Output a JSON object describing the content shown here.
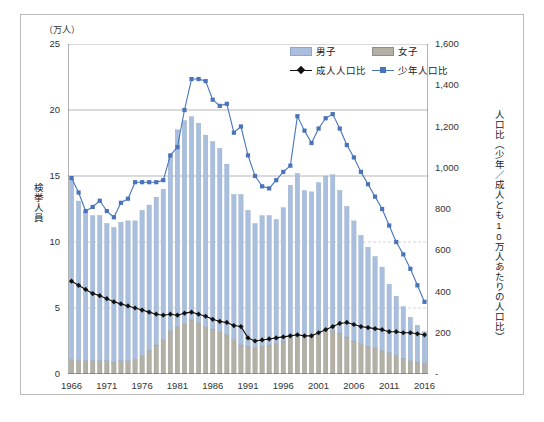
{
  "figure": {
    "left_unit": "（万人）",
    "left_axis_title": "検挙人員",
    "right_axis_title": "人口比（少年／成人とも10万人あたりの人口比）",
    "caption": "",
    "border_color": "#b9b9b9"
  },
  "legend": {
    "items": [
      {
        "label": "男子",
        "type": "bar",
        "color": "#aabfdd",
        "name": "legend-male"
      },
      {
        "label": "女子",
        "type": "bar",
        "color": "#b3b0a6",
        "name": "legend-female"
      },
      {
        "label": "成人人口比",
        "type": "line-diamond",
        "color": "#111111",
        "name": "legend-adult-ratio"
      },
      {
        "label": "少年人口比",
        "type": "line-square",
        "color": "#4a74ba",
        "name": "legend-juvenile-ratio"
      }
    ]
  },
  "chart_data": {
    "type": "bar",
    "title": "",
    "subtitle": "",
    "xlabel": "",
    "ylabel": "検挙人員",
    "y2label": "人口比（少年／成人とも10万人あたりの人口比）",
    "unit_left": "万人",
    "ylim": [
      0,
      25
    ],
    "yticks": [
      0,
      5,
      10,
      15,
      20,
      25
    ],
    "y2lim": [
      0,
      1600
    ],
    "y2ticks": [
      "-",
      "200",
      "400",
      "600",
      "800",
      "1,000",
      "1,200",
      "1,400",
      "1,600"
    ],
    "y2tick_values": [
      0,
      200,
      400,
      600,
      800,
      1000,
      1200,
      1400,
      1600
    ],
    "grid": "horizontal",
    "legend_position": "top-right",
    "stacked": true,
    "x": [
      1966,
      1967,
      1968,
      1969,
      1970,
      1971,
      1972,
      1973,
      1974,
      1975,
      1976,
      1977,
      1978,
      1979,
      1980,
      1981,
      1982,
      1983,
      1984,
      1985,
      1986,
      1987,
      1988,
      1989,
      1990,
      1991,
      1992,
      1993,
      1994,
      1995,
      1996,
      1997,
      1998,
      1999,
      2000,
      2001,
      2002,
      2003,
      2004,
      2005,
      2006,
      2007,
      2008,
      2009,
      2010,
      2011,
      2012,
      2013,
      2014,
      2015,
      2016
    ],
    "xticks": [
      1966,
      1971,
      1976,
      1981,
      1986,
      1991,
      1996,
      2001,
      2006,
      2011,
      2016
    ],
    "series": [
      {
        "name": "女子",
        "color": "#b3b0a6",
        "axis": "left",
        "values": [
          1.1,
          1.0,
          1.0,
          1.0,
          1.0,
          1.0,
          0.9,
          1.0,
          1.0,
          1.1,
          1.4,
          1.8,
          2.2,
          2.6,
          3.3,
          3.6,
          3.8,
          4.1,
          3.9,
          3.6,
          3.4,
          3.2,
          3.0,
          2.6,
          2.2,
          2.1,
          2.0,
          2.1,
          2.2,
          2.3,
          2.5,
          2.8,
          2.9,
          2.8,
          2.8,
          3.0,
          3.2,
          3.3,
          3.1,
          2.8,
          2.5,
          2.3,
          2.1,
          2.0,
          1.8,
          1.6,
          1.4,
          1.2,
          1.0,
          0.9,
          0.8
        ]
      },
      {
        "name": "男子",
        "color": "#aabfdd",
        "axis": "left",
        "values": [
          13.7,
          12.1,
          11.3,
          11.0,
          11.0,
          10.4,
          10.2,
          10.5,
          10.6,
          10.5,
          11.0,
          11.0,
          11.2,
          11.4,
          13.3,
          14.9,
          15.4,
          15.4,
          15.1,
          14.5,
          14.2,
          13.9,
          12.9,
          11.0,
          11.4,
          10.3,
          9.4,
          9.9,
          9.8,
          9.4,
          10.1,
          11.5,
          12.3,
          11.1,
          11.0,
          11.5,
          11.8,
          11.8,
          10.8,
          9.9,
          9.1,
          8.2,
          7.5,
          6.9,
          6.3,
          5.2,
          4.5,
          3.9,
          3.3,
          2.8,
          2.4
        ]
      }
    ],
    "totals": [
      14.8,
      13.1,
      12.3,
      12.0,
      12.0,
      11.4,
      11.1,
      11.5,
      11.6,
      11.6,
      12.4,
      12.8,
      13.4,
      14.0,
      16.6,
      18.5,
      19.2,
      19.5,
      19.0,
      18.1,
      17.6,
      17.1,
      15.9,
      13.6,
      13.6,
      12.4,
      11.4,
      12.0,
      12.0,
      11.7,
      12.6,
      14.3,
      15.2,
      13.9,
      13.8,
      14.5,
      15.0,
      15.1,
      13.9,
      12.7,
      11.6,
      10.5,
      9.6,
      8.9,
      8.1,
      6.8,
      5.9,
      5.1,
      4.3,
      3.7,
      3.2
    ],
    "lines": [
      {
        "name": "少年人口比",
        "color": "#4a74ba",
        "marker": "square",
        "axis": "right",
        "values": [
          950,
          880,
          790,
          810,
          840,
          790,
          760,
          830,
          850,
          930,
          930,
          930,
          930,
          940,
          1060,
          1100,
          1280,
          1430,
          1430,
          1420,
          1330,
          1300,
          1310,
          1170,
          1200,
          1060,
          960,
          910,
          900,
          940,
          980,
          1010,
          1250,
          1180,
          1120,
          1190,
          1240,
          1260,
          1190,
          1110,
          1050,
          980,
          920,
          860,
          800,
          720,
          640,
          580,
          510,
          430,
          350
        ]
      },
      {
        "name": "成人人口比",
        "color": "#111111",
        "marker": "diamond",
        "axis": "right",
        "values": [
          450,
          430,
          410,
          390,
          380,
          365,
          350,
          340,
          330,
          320,
          310,
          300,
          290,
          285,
          290,
          285,
          295,
          300,
          290,
          280,
          265,
          255,
          250,
          235,
          230,
          175,
          160,
          165,
          170,
          175,
          180,
          185,
          190,
          185,
          185,
          200,
          215,
          230,
          245,
          250,
          240,
          230,
          225,
          220,
          215,
          205,
          205,
          200,
          200,
          195,
          190
        ]
      }
    ]
  },
  "axes": {
    "left_ticks": [
      "0",
      "5",
      "10",
      "15",
      "20",
      "25"
    ],
    "right_ticks": [
      "-",
      "200",
      "400",
      "600",
      "800",
      "1,000",
      "1,200",
      "1,400",
      "1,600"
    ],
    "x_ticks": [
      "1966",
      "1971",
      "1976",
      "1981",
      "1986",
      "1991",
      "1996",
      "2001",
      "2006",
      "2011",
      "2016"
    ]
  }
}
